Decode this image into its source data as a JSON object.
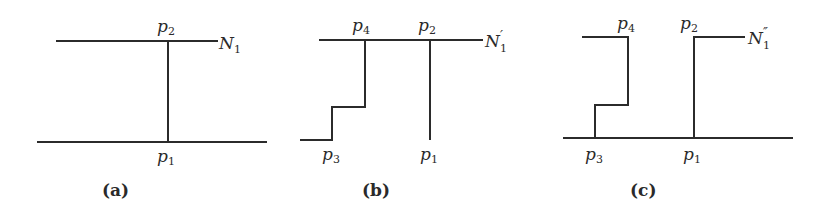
{
  "panels": [
    {
      "caption": "(a)",
      "labels": {
        "top_left": "p",
        "top_left_sub": "2",
        "bottom": "p",
        "bottom_sub": "1",
        "net": "N",
        "net_sub": "1",
        "net_prime": ""
      }
    },
    {
      "caption": "(b)",
      "labels": {
        "p4": "p",
        "p4_sub": "4",
        "p2": "p",
        "p2_sub": "2",
        "p3": "p",
        "p3_sub": "3",
        "p1": "p",
        "p1_sub": "1",
        "net": "N",
        "net_sub": "1",
        "net_prime": "′"
      }
    },
    {
      "caption": "(c)",
      "labels": {
        "p4": "p",
        "p4_sub": "4",
        "p2": "p",
        "p2_sub": "2",
        "p3": "p",
        "p3_sub": "3",
        "p1": "p",
        "p1_sub": "1",
        "net": "N",
        "net_sub": "1",
        "net_prime": "″"
      }
    }
  ]
}
